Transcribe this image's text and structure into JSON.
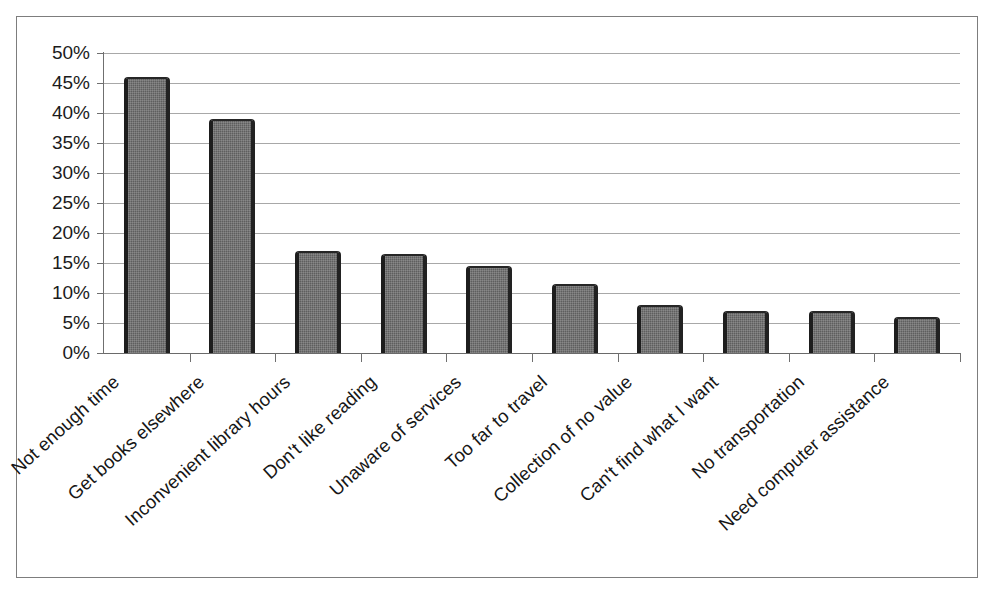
{
  "figure": {
    "name": "reasons-for-not-using-library-bar-chart",
    "background_color": "#ffffff",
    "border_color": "#7d7d7d",
    "bar_color": "#5e5e5e",
    "bar_edge_color": "#1d1d1d",
    "gridline_color": "#a8a8a8",
    "axis_color": "#6f6f6f",
    "text_color": "#161616"
  },
  "chart_data": {
    "type": "bar",
    "title": "",
    "subtitle": "",
    "xlabel": "",
    "ylabel": "",
    "orientation": "vertical",
    "grid": true,
    "grid_axis": "y",
    "legend": false,
    "legend_position": "none",
    "ylim": [
      0,
      50
    ],
    "y_tick_step": 5,
    "y_tick_labels": [
      "50%",
      "45%",
      "40%",
      "35%",
      "30%",
      "25%",
      "20%",
      "15%",
      "10%",
      "5%",
      "0%"
    ],
    "y_tick_values": [
      50,
      45,
      40,
      35,
      30,
      25,
      20,
      15,
      10,
      5,
      0
    ],
    "value_unit": "%",
    "categories": [
      "Not enough time",
      "Get books elsewhere",
      "Inconvenient library hours",
      "Don't like reading",
      "Unaware of services",
      "Too far to travel",
      "Collection of no value",
      "Can't find what I want",
      "No transportation",
      "Need computer assistance"
    ],
    "values": [
      46,
      39,
      17,
      16.5,
      14.5,
      11.5,
      8,
      7,
      7,
      6
    ],
    "label_rotation_degrees": -42,
    "data_labels_shown": false
  }
}
